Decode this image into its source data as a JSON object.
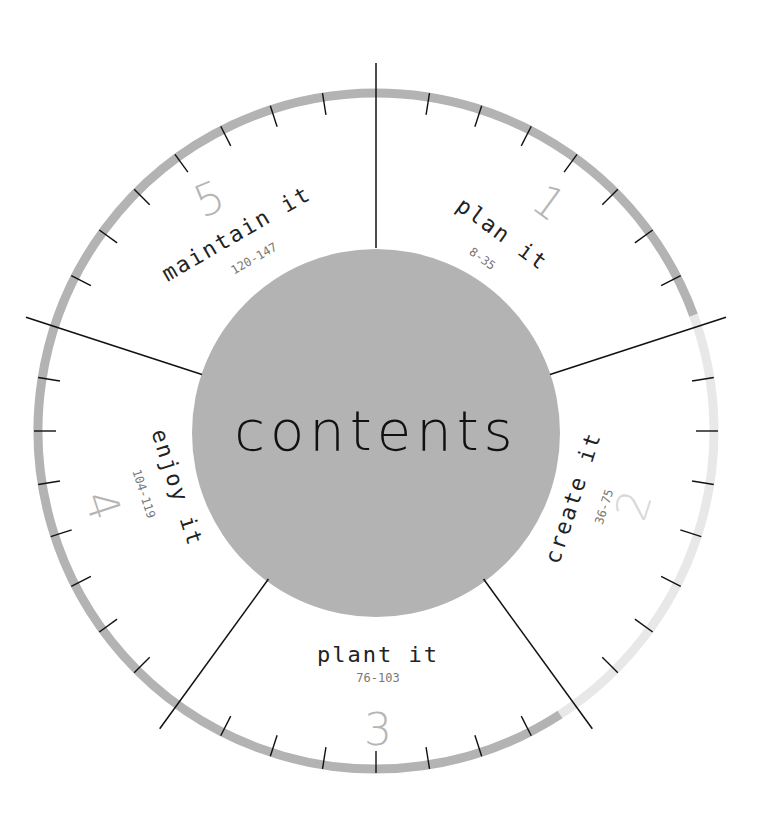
{
  "center": {
    "title": "contents"
  },
  "colors": {
    "ring_dark": "#b3b3b3",
    "ring_light": "#e8e8e8",
    "hub": "#b3b3b3",
    "line": "#111111",
    "numeral": "#b5b5b5",
    "label": "#222222",
    "pages": "#777777"
  },
  "sections": [
    {
      "number": "1",
      "label": "plan it",
      "pages": "8-35"
    },
    {
      "number": "2",
      "label": "create it",
      "pages": "36-75"
    },
    {
      "number": "3",
      "label": "plant it",
      "pages": "76-103"
    },
    {
      "number": "4",
      "label": "enjoy it",
      "pages": "104-119"
    },
    {
      "number": "5",
      "label": "maintain it",
      "pages": "120-147"
    }
  ]
}
